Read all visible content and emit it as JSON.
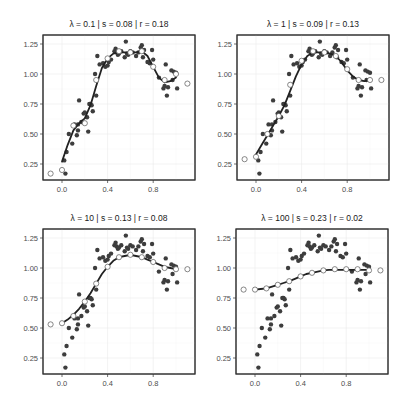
{
  "chart_data": [
    {
      "type": "scatter",
      "title": "λ = 0.1 | s = 0.08 | r = 0.18",
      "lambda": "0.1",
      "s": "0.08",
      "r": "0.18",
      "xlabel": "",
      "ylabel": "",
      "x_ticks": [
        "0.0",
        "0.4",
        "0.8"
      ],
      "y_ticks": [
        "0.25",
        "0.50",
        "0.75",
        "1.00",
        "1.25"
      ],
      "xlim": [
        -0.12,
        1.15
      ],
      "ylim": [
        0.12,
        1.3
      ],
      "grid": true,
      "series": [
        {
          "name": "fitted smoothing spline",
          "kind": "line",
          "x": [
            0.0,
            0.05,
            0.1,
            0.15,
            0.2,
            0.25,
            0.3,
            0.35,
            0.4,
            0.45,
            0.5,
            0.55,
            0.6,
            0.65,
            0.7,
            0.75,
            0.8,
            0.85,
            0.9,
            0.95,
            1.0
          ],
          "y": [
            0.27,
            0.41,
            0.53,
            0.59,
            0.63,
            0.74,
            0.9,
            1.05,
            1.13,
            1.17,
            1.18,
            1.18,
            1.18,
            1.18,
            1.19,
            1.15,
            1.06,
            0.97,
            0.93,
            0.94,
            0.97
          ]
        },
        {
          "name": "knots (open circles)",
          "kind": "scatter-open",
          "x": [
            -0.1,
            0.0,
            0.1,
            0.2,
            0.3,
            0.4,
            0.5,
            0.6,
            0.7,
            0.8,
            0.9,
            1.0,
            1.1
          ],
          "y": [
            0.17,
            0.2,
            0.57,
            0.59,
            0.95,
            1.13,
            1.19,
            1.18,
            1.19,
            1.06,
            0.95,
            1.0,
            0.92
          ]
        }
      ]
    },
    {
      "type": "scatter",
      "title": "λ = 1 | s = 0.09 | r = 0.13",
      "lambda": "1",
      "s": "0.09",
      "r": "0.13",
      "xlabel": "",
      "ylabel": "",
      "x_ticks": [
        "0.0",
        "0.4",
        "0.8"
      ],
      "y_ticks": [
        "0.25",
        "0.50",
        "0.75",
        "1.00",
        "1.25"
      ],
      "xlim": [
        -0.12,
        1.15
      ],
      "ylim": [
        0.12,
        1.3
      ],
      "grid": true,
      "series": [
        {
          "name": "fitted smoothing spline",
          "kind": "line",
          "x": [
            0.0,
            0.05,
            0.1,
            0.15,
            0.2,
            0.25,
            0.3,
            0.35,
            0.4,
            0.45,
            0.5,
            0.55,
            0.6,
            0.65,
            0.7,
            0.75,
            0.8,
            0.85,
            0.9,
            0.95,
            1.0
          ],
          "y": [
            0.33,
            0.41,
            0.49,
            0.57,
            0.65,
            0.74,
            0.86,
            0.98,
            1.08,
            1.15,
            1.18,
            1.18,
            1.18,
            1.17,
            1.15,
            1.1,
            1.03,
            0.98,
            0.95,
            0.94,
            0.95
          ]
        },
        {
          "name": "knots (open circles)",
          "kind": "scatter-open",
          "x": [
            -0.1,
            0.0,
            0.1,
            0.2,
            0.3,
            0.4,
            0.5,
            0.6,
            0.7,
            0.8,
            0.9,
            1.0,
            1.1
          ],
          "y": [
            0.29,
            0.31,
            0.5,
            0.65,
            0.91,
            1.11,
            1.19,
            1.18,
            1.15,
            1.04,
            0.95,
            0.95,
            0.95
          ]
        }
      ]
    },
    {
      "type": "scatter",
      "title": "λ = 10 | s = 0.13 | r = 0.08",
      "lambda": "10",
      "s": "0.13",
      "r": "0.08",
      "xlabel": "",
      "ylabel": "",
      "x_ticks": [
        "0.0",
        "0.4",
        "0.8"
      ],
      "y_ticks": [
        "0.25",
        "0.50",
        "0.75",
        "1.00",
        "1.25"
      ],
      "xlim": [
        -0.12,
        1.15
      ],
      "ylim": [
        0.12,
        1.3
      ],
      "grid": true,
      "series": [
        {
          "name": "fitted smoothing spline",
          "kind": "line",
          "x": [
            0.0,
            0.05,
            0.1,
            0.15,
            0.2,
            0.25,
            0.3,
            0.35,
            0.4,
            0.45,
            0.5,
            0.55,
            0.6,
            0.65,
            0.7,
            0.75,
            0.8,
            0.85,
            0.9,
            0.95,
            1.0
          ],
          "y": [
            0.54,
            0.57,
            0.61,
            0.66,
            0.72,
            0.79,
            0.87,
            0.95,
            1.01,
            1.06,
            1.09,
            1.1,
            1.11,
            1.1,
            1.09,
            1.07,
            1.05,
            1.03,
            1.01,
            1.0,
            0.99
          ]
        },
        {
          "name": "knots (open circles)",
          "kind": "scatter-open",
          "x": [
            -0.1,
            0.0,
            0.1,
            0.2,
            0.3,
            0.4,
            0.5,
            0.6,
            0.7,
            0.8,
            0.9,
            1.0,
            1.1
          ],
          "y": [
            0.53,
            0.54,
            0.6,
            0.72,
            0.87,
            1.01,
            1.09,
            1.11,
            1.09,
            1.05,
            1.0,
            0.99,
            0.99
          ]
        }
      ]
    },
    {
      "type": "scatter",
      "title": "λ = 100 | s = 0.23 | r = 0.02",
      "lambda": "100",
      "s": "0.23",
      "r": "0.02",
      "xlabel": "",
      "ylabel": "",
      "x_ticks": [
        "0.0",
        "0.4",
        "0.8"
      ],
      "y_ticks": [
        "0.25",
        "0.50",
        "0.75",
        "1.00",
        "1.25"
      ],
      "xlim": [
        -0.12,
        1.15
      ],
      "ylim": [
        0.12,
        1.3
      ],
      "grid": true,
      "series": [
        {
          "name": "fitted smoothing spline",
          "kind": "line",
          "x": [
            0.0,
            0.05,
            0.1,
            0.15,
            0.2,
            0.25,
            0.3,
            0.35,
            0.4,
            0.45,
            0.5,
            0.55,
            0.6,
            0.65,
            0.7,
            0.75,
            0.8,
            0.85,
            0.9,
            0.95,
            1.0
          ],
          "y": [
            0.82,
            0.825,
            0.83,
            0.845,
            0.86,
            0.875,
            0.89,
            0.91,
            0.93,
            0.95,
            0.96,
            0.97,
            0.98,
            0.985,
            0.985,
            0.985,
            0.985,
            0.985,
            0.985,
            0.985,
            0.985
          ]
        },
        {
          "name": "knots (open circles)",
          "kind": "scatter-open",
          "x": [
            -0.1,
            0.0,
            0.1,
            0.2,
            0.3,
            0.4,
            0.5,
            0.6,
            0.7,
            0.8,
            0.9,
            1.0,
            1.1
          ],
          "y": [
            0.82,
            0.82,
            0.83,
            0.86,
            0.89,
            0.93,
            0.96,
            0.98,
            0.99,
            0.99,
            0.99,
            0.98,
            0.98
          ]
        }
      ]
    }
  ],
  "observations": {
    "name": "data points (filled, shared across panels)",
    "x": [
      0.02,
      0.03,
      0.04,
      0.06,
      0.09,
      0.11,
      0.13,
      0.14,
      0.14,
      0.15,
      0.17,
      0.19,
      0.2,
      0.22,
      0.23,
      0.24,
      0.25,
      0.26,
      0.27,
      0.29,
      0.3,
      0.31,
      0.33,
      0.36,
      0.38,
      0.4,
      0.41,
      0.43,
      0.46,
      0.47,
      0.48,
      0.49,
      0.5,
      0.52,
      0.55,
      0.56,
      0.57,
      0.58,
      0.6,
      0.62,
      0.65,
      0.67,
      0.69,
      0.7,
      0.71,
      0.72,
      0.75,
      0.77,
      0.79,
      0.8,
      0.85,
      0.89,
      0.9,
      0.91,
      0.92,
      0.93,
      0.96,
      0.97,
      0.98,
      1.0,
      1.01
    ],
    "y": [
      0.28,
      0.17,
      0.35,
      0.5,
      0.42,
      0.58,
      0.49,
      0.53,
      0.58,
      0.78,
      0.6,
      0.67,
      0.68,
      0.64,
      0.52,
      0.75,
      0.75,
      0.74,
      0.69,
      1.0,
      0.82,
      1.15,
      1.08,
      1.09,
      1.06,
      1.07,
      1.1,
      1.12,
      1.19,
      1.21,
      1.18,
      1.16,
      1.17,
      1.19,
      1.14,
      1.27,
      1.17,
      1.16,
      1.19,
      1.18,
      1.15,
      1.18,
      1.22,
      1.24,
      1.14,
      1.2,
      1.1,
      1.09,
      1.2,
      1.12,
      0.97,
      0.88,
      0.9,
      1.08,
      0.82,
      0.89,
      1.03,
      0.95,
      1.02,
      1.01,
      0.88
    ]
  },
  "legend": null
}
